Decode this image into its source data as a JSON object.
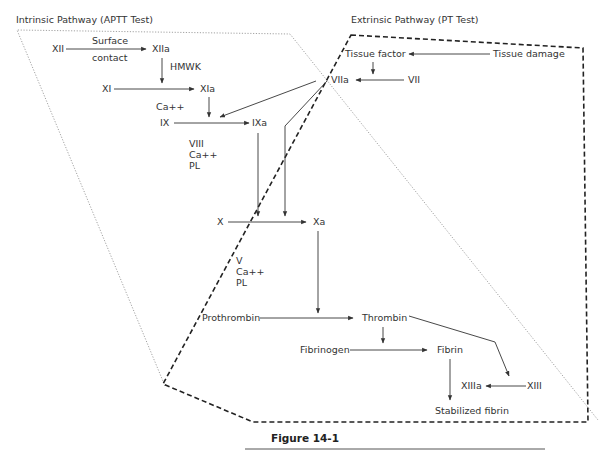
{
  "diagram": {
    "titles": {
      "intrinsic": "Intrinsic Pathway (APTT Test)",
      "extrinsic": "Extrinsic Pathway (PT Test)"
    },
    "nodes": {
      "xii": "XII",
      "surface": "Surface",
      "contact": "contact",
      "xiia": "XIIa",
      "hmwk": "HMWK",
      "xi": "XI",
      "xia": "XIa",
      "ca1": "Ca++",
      "ix": "IX",
      "ixa": "IXa",
      "viii": "VIII",
      "ca2": "Ca++",
      "pl1": "PL",
      "tissue_factor": "Tissue factor",
      "tissue_damage": "Tissue damage",
      "viia": "VIIa",
      "vii": "VII",
      "x": "X",
      "xa": "Xa",
      "v": "V",
      "ca3": "Ca++",
      "pl2": "PL",
      "prothrombin": "Prothrombin",
      "thrombin": "Thrombin",
      "fibrinogen": "Fibrinogen",
      "fibrin": "Fibrin",
      "xiiia": "XIIIa",
      "xiii": "XIII",
      "stabilized_fibrin": "Stabilized fibrin"
    },
    "caption": "Figure 14-1",
    "colors": {
      "line": "#333333",
      "dotted": "#8a8a8a",
      "dashed": "#222222"
    }
  }
}
